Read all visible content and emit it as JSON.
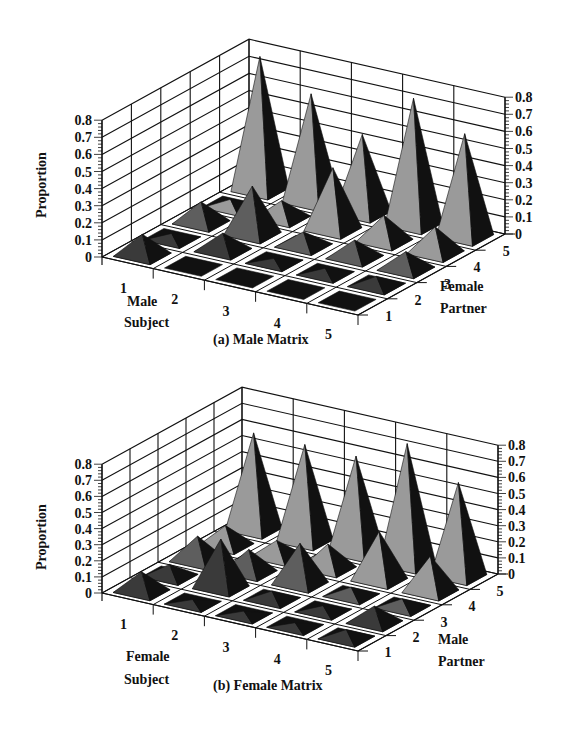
{
  "figure": {
    "panels": [
      {
        "id": "male",
        "caption": "(a) Male Matrix",
        "subject_label_line1": "Male",
        "subject_label_line2": "Subject",
        "partner_label_line1": "Female",
        "partner_label_line2": "Partner",
        "z_label": "Proportion"
      },
      {
        "id": "female",
        "caption": "(b) Female Matrix",
        "subject_label_line1": "Female",
        "subject_label_line2": "Subject",
        "partner_label_line1": "Male",
        "partner_label_line2": "Partner",
        "z_label": "Proportion"
      }
    ]
  },
  "chart_data": [
    {
      "type": "bar3d",
      "title": "(a) Male Matrix",
      "xlabel": "Male Subject",
      "ylabel": "Female Partner",
      "zlabel": "Proportion",
      "x_categories": [
        "1",
        "2",
        "3",
        "4",
        "5"
      ],
      "y_categories": [
        "1",
        "2",
        "3",
        "4",
        "5"
      ],
      "z_ticks": [
        "0",
        "0.1",
        "0.2",
        "0.3",
        "0.4",
        "0.5",
        "0.6",
        "0.7",
        "0.8"
      ],
      "zlim": [
        0,
        0.8
      ],
      "grid": true,
      "note": "values[subject-1][partner-1]",
      "values": [
        [
          0.12,
          0.03,
          0.12,
          0.04,
          0.78
        ],
        [
          0.01,
          0.1,
          0.28,
          0.1,
          0.63
        ],
        [
          0.01,
          0.02,
          0.08,
          0.36,
          0.46
        ],
        [
          0.01,
          0.03,
          0.1,
          0.15,
          0.74
        ],
        [
          0.01,
          0.05,
          0.1,
          0.15,
          0.6
        ]
      ]
    },
    {
      "type": "bar3d",
      "title": "(b) Female Matrix",
      "xlabel": "Female Subject",
      "ylabel": "Male Partner",
      "zlabel": "Proportion",
      "x_categories": [
        "1",
        "2",
        "3",
        "4",
        "5"
      ],
      "y_categories": [
        "1",
        "2",
        "3",
        "4",
        "5"
      ],
      "z_ticks": [
        "0",
        "0.1",
        "0.2",
        "0.3",
        "0.4",
        "0.5",
        "0.6",
        "0.7",
        "0.8"
      ],
      "zlim": [
        0,
        0.8
      ],
      "grid": true,
      "note": "values[subject-1][partner-1]",
      "values": [
        [
          0.12,
          0.07,
          0.15,
          0.12,
          0.6
        ],
        [
          0.02,
          0.3,
          0.14,
          0.1,
          0.6
        ],
        [
          0.02,
          0.05,
          0.25,
          0.15,
          0.6
        ],
        [
          0.02,
          0.03,
          0.05,
          0.3,
          0.75
        ],
        [
          0.05,
          0.1,
          0.05,
          0.22,
          0.58
        ]
      ]
    }
  ],
  "style": {
    "light_face": "#9a9a9a",
    "dark_face": "#111111",
    "mid_face": "#5e5e5e",
    "shadow_base": "#111111",
    "line_color": "#111111"
  }
}
